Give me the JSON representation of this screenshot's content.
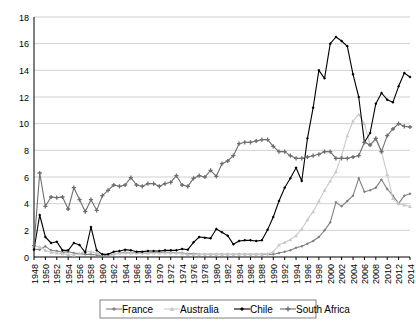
{
  "chart_data": {
    "type": "line",
    "title": "",
    "subtitle": "",
    "xlabel": "",
    "ylabel": "",
    "xlim": [
      1948,
      2014
    ],
    "ylim": [
      0,
      18
    ],
    "ytick_step": 2,
    "xtick_step": 2,
    "grid": "horizontal",
    "legend_position": "bottom",
    "yticks": [
      0,
      2,
      4,
      6,
      8,
      10,
      12,
      14,
      16,
      18
    ],
    "x": [
      1948,
      1949,
      1950,
      1951,
      1952,
      1953,
      1954,
      1955,
      1956,
      1957,
      1958,
      1959,
      1960,
      1961,
      1962,
      1963,
      1964,
      1965,
      1966,
      1967,
      1968,
      1969,
      1970,
      1971,
      1972,
      1973,
      1974,
      1975,
      1976,
      1977,
      1978,
      1979,
      1980,
      1981,
      1982,
      1983,
      1984,
      1985,
      1986,
      1987,
      1988,
      1989,
      1990,
      1991,
      1992,
      1993,
      1994,
      1995,
      1996,
      1997,
      1998,
      1999,
      2000,
      2001,
      2002,
      2003,
      2004,
      2005,
      2006,
      2007,
      2008,
      2009,
      2010,
      2011,
      2012,
      2013,
      2014
    ],
    "xtick_labels": [
      "1948",
      "1950",
      "1952",
      "1954",
      "1956",
      "1958",
      "1960",
      "1962",
      "1964",
      "1966",
      "1968",
      "1970",
      "1972",
      "1974",
      "1976",
      "1978",
      "1980",
      "1982",
      "1984",
      "1986",
      "1988",
      "1990",
      "1992",
      "1994",
      "1996",
      "1998",
      "2000",
      "2002",
      "2004",
      "2006",
      "2008",
      "2010",
      "2012",
      "2014"
    ],
    "series": [
      {
        "name": "France",
        "color": "#808080",
        "marker": "diamond",
        "values": [
          0.6,
          0.55,
          0.8,
          0.5,
          0.45,
          0.35,
          0.4,
          0.3,
          0.25,
          0.2,
          0.2,
          0.15,
          0.1,
          0.15,
          0.2,
          0.3,
          0.35,
          0.3,
          0.3,
          0.3,
          0.3,
          0.35,
          0.35,
          0.35,
          0.35,
          0.3,
          0.3,
          0.25,
          0.25,
          0.2,
          0.2,
          0.2,
          0.2,
          0.2,
          0.2,
          0.2,
          0.2,
          0.2,
          0.2,
          0.2,
          0.2,
          0.2,
          0.2,
          0.3,
          0.4,
          0.5,
          0.7,
          0.8,
          1.0,
          1.2,
          1.5,
          2.0,
          2.6,
          4.1,
          3.8,
          4.2,
          4.6,
          5.9,
          4.9,
          5.0,
          5.2,
          5.8,
          5.1,
          4.6,
          4.0,
          4.6,
          4.75
        ]
      },
      {
        "name": "Australia",
        "color": "#c9c9c9",
        "marker": "triangle",
        "values": [
          0.8,
          0.75,
          0.5,
          0.35,
          0.3,
          0.25,
          0.2,
          0.15,
          0.25,
          0.45,
          0.4,
          0.3,
          0.2,
          0.2,
          0.25,
          0.3,
          0.3,
          0.3,
          0.3,
          0.3,
          0.3,
          0.3,
          0.3,
          0.3,
          0.3,
          0.3,
          0.25,
          0.2,
          0.2,
          0.2,
          0.2,
          0.2,
          0.2,
          0.2,
          0.2,
          0.2,
          0.2,
          0.2,
          0.2,
          0.2,
          0.2,
          0.25,
          0.4,
          0.9,
          1.1,
          1.3,
          1.6,
          2.1,
          2.8,
          3.4,
          4.2,
          5.0,
          5.7,
          6.4,
          7.6,
          9.1,
          10.2,
          10.7,
          10.0,
          8.4,
          8.8,
          7.9,
          6.2,
          4.4,
          4.0,
          3.9,
          3.8
        ]
      },
      {
        "name": "Chile",
        "color": "#000000",
        "marker": "diamond",
        "values": [
          0.55,
          3.15,
          1.5,
          1.05,
          1.15,
          0.5,
          0.5,
          1.05,
          0.9,
          0.35,
          2.25,
          0.5,
          0.2,
          0.2,
          0.4,
          0.45,
          0.55,
          0.5,
          0.4,
          0.4,
          0.45,
          0.45,
          0.45,
          0.5,
          0.5,
          0.5,
          0.6,
          0.55,
          1.1,
          1.5,
          1.45,
          1.4,
          2.1,
          1.85,
          1.6,
          0.95,
          1.2,
          1.25,
          1.25,
          1.2,
          1.25,
          2.05,
          3.0,
          4.2,
          5.2,
          5.9,
          6.7,
          5.7,
          8.9,
          11.2,
          14.0,
          13.4,
          16.0,
          16.5,
          16.2,
          15.8,
          13.7,
          12.0,
          8.6,
          9.3,
          11.5,
          12.3,
          11.8,
          11.6,
          12.8,
          13.8,
          13.5
        ]
      },
      {
        "name": "South Africa",
        "color": "#6e6e6e",
        "marker": "plus",
        "values": [
          0.85,
          6.3,
          3.8,
          4.5,
          4.45,
          4.5,
          3.6,
          5.2,
          4.3,
          3.4,
          4.3,
          3.5,
          4.6,
          5.0,
          5.4,
          5.3,
          5.4,
          5.95,
          5.4,
          5.3,
          5.5,
          5.5,
          5.3,
          5.5,
          5.6,
          6.1,
          5.4,
          5.3,
          5.9,
          6.1,
          6.0,
          6.5,
          6.05,
          7.0,
          7.2,
          7.6,
          8.5,
          8.6,
          8.6,
          8.7,
          8.8,
          8.8,
          8.3,
          7.9,
          7.9,
          7.6,
          7.4,
          7.4,
          7.5,
          7.6,
          7.7,
          7.9,
          7.9,
          7.4,
          7.4,
          7.4,
          7.5,
          7.6,
          8.6,
          8.4,
          8.9,
          7.9,
          9.1,
          9.6,
          10.0,
          9.8,
          9.75
        ]
      }
    ]
  },
  "legend": {
    "items": [
      {
        "label": "France"
      },
      {
        "label": "Australia"
      },
      {
        "label": "Chile"
      },
      {
        "label": "South Africa"
      }
    ]
  }
}
